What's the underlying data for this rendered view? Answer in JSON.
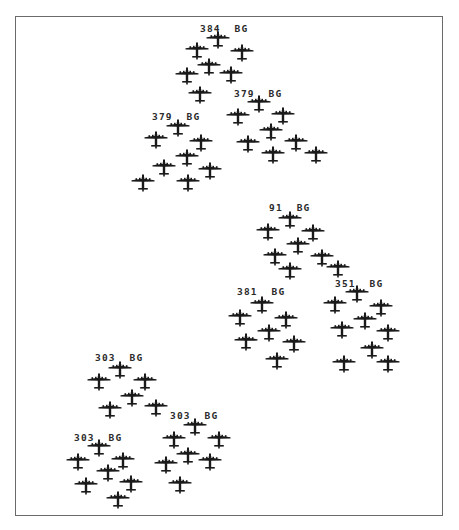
{
  "diagram": {
    "type": "bomber-formation",
    "plane_color": "#1a1a1a",
    "frame_color": "#6a6a6a",
    "groups": [
      {
        "id": "384",
        "label": "384  BG",
        "label_pos": [
          200,
          28
        ],
        "planes": [
          [
            218,
            40
          ],
          [
            197,
            51
          ],
          [
            242,
            53
          ],
          [
            209,
            67
          ],
          [
            187,
            76
          ],
          [
            231,
            75
          ],
          [
            200,
            95
          ]
        ]
      },
      {
        "id": "379-left",
        "label": "379  BG",
        "label_pos": [
          152,
          116
        ],
        "planes": [
          [
            178,
            128
          ],
          [
            156,
            140
          ],
          [
            201,
            143
          ],
          [
            187,
            158
          ],
          [
            164,
            168
          ],
          [
            210,
            171
          ],
          [
            143,
            183
          ],
          [
            188,
            183
          ]
        ]
      },
      {
        "id": "379-right",
        "label": "379  BG",
        "label_pos": [
          234,
          93
        ],
        "planes": [
          [
            259,
            104
          ],
          [
            238,
            117
          ],
          [
            283,
            116
          ],
          [
            271,
            132
          ],
          [
            248,
            144
          ],
          [
            296,
            143
          ],
          [
            273,
            155
          ],
          [
            316,
            155
          ]
        ]
      },
      {
        "id": "91",
        "label": "91  BG",
        "label_pos": [
          269,
          207
        ],
        "planes": [
          [
            290,
            220
          ],
          [
            268,
            232
          ],
          [
            313,
            233
          ],
          [
            298,
            246
          ],
          [
            275,
            257
          ],
          [
            322,
            258
          ],
          [
            290,
            271
          ],
          [
            338,
            269
          ]
        ]
      },
      {
        "id": "381",
        "label": "381  BG",
        "label_pos": [
          237,
          291
        ],
        "planes": [
          [
            262,
            305
          ],
          [
            240,
            318
          ],
          [
            286,
            320
          ],
          [
            269,
            333
          ],
          [
            246,
            342
          ],
          [
            294,
            344
          ],
          [
            277,
            361
          ]
        ]
      },
      {
        "id": "351",
        "label": "351  BG",
        "label_pos": [
          335,
          283
        ],
        "planes": [
          [
            357,
            294
          ],
          [
            335,
            305
          ],
          [
            381,
            308
          ],
          [
            365,
            321
          ],
          [
            342,
            330
          ],
          [
            388,
            333
          ],
          [
            372,
            350
          ],
          [
            344,
            364
          ],
          [
            388,
            364
          ]
        ]
      },
      {
        "id": "303-top",
        "label": "303  BG",
        "label_pos": [
          95,
          357
        ],
        "planes": [
          [
            120,
            370
          ],
          [
            99,
            382
          ],
          [
            145,
            382
          ],
          [
            132,
            398
          ],
          [
            110,
            410
          ],
          [
            156,
            408
          ]
        ]
      },
      {
        "id": "303-lower-right",
        "label": "303  BG",
        "label_pos": [
          170,
          415
        ],
        "planes": [
          [
            195,
            427
          ],
          [
            174,
            440
          ],
          [
            219,
            440
          ],
          [
            188,
            456
          ],
          [
            166,
            465
          ],
          [
            210,
            462
          ],
          [
            180,
            485
          ]
        ]
      },
      {
        "id": "303-lower-left",
        "label": "303  BG",
        "label_pos": [
          74,
          437
        ],
        "planes": [
          [
            99,
            448
          ],
          [
            78,
            462
          ],
          [
            123,
            461
          ],
          [
            108,
            473
          ],
          [
            86,
            486
          ],
          [
            131,
            484
          ],
          [
            118,
            500
          ]
        ]
      }
    ]
  }
}
